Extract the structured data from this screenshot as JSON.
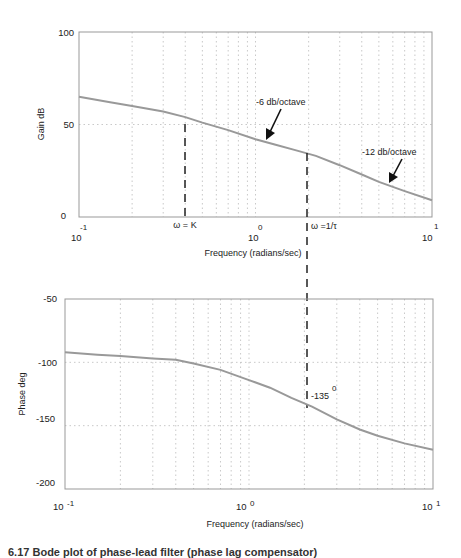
{
  "chart_data": [
    {
      "type": "line",
      "title": "",
      "xlabel": "Frequency (radians/sec)",
      "ylabel": "Gain dB",
      "xscale": "log",
      "xlim": [
        0.1,
        10
      ],
      "ylim": [
        0,
        100
      ],
      "yticks": [
        0,
        50,
        100
      ],
      "xticks": [
        {
          "base": "10",
          "exp": "-1"
        },
        {
          "base": "10",
          "exp": "0"
        },
        {
          "base": "10",
          "exp": "1"
        }
      ],
      "grid": true,
      "series": [
        {
          "name": "gain",
          "x": [
            0.1,
            0.15,
            0.2,
            0.3,
            0.4,
            0.5,
            0.7,
            1.0,
            1.3,
            1.7,
            2.2,
            3.0,
            4.0,
            5.0,
            7.0,
            10.0
          ],
          "y": [
            65,
            62,
            60,
            57,
            54,
            51,
            47,
            42,
            39,
            36,
            33,
            28,
            23,
            19,
            14,
            9
          ]
        }
      ],
      "annotations": [
        {
          "text": "-6 db/octave",
          "x": 1.3,
          "y": 40
        },
        {
          "text": "-12 db/octave",
          "x": 5.5,
          "y": 18
        },
        {
          "text": "ω = K",
          "x": 0.48,
          "marker": "dashed-vertical"
        },
        {
          "text": "ω =1/τ",
          "x": 2.2,
          "marker": "dashed-vertical"
        }
      ]
    },
    {
      "type": "line",
      "title": "",
      "xlabel": "Frequency (radians/sec)",
      "ylabel": "Phase deg",
      "xscale": "log",
      "xlim": [
        0.1,
        10
      ],
      "ylim": [
        -200,
        -50
      ],
      "yticks": [
        -200,
        -150,
        -100,
        -50
      ],
      "xticks": [
        {
          "base": "10",
          "exp": "-1"
        },
        {
          "base": "10",
          "exp": "0"
        },
        {
          "base": "10",
          "exp": "1"
        }
      ],
      "grid": true,
      "series": [
        {
          "name": "phase",
          "x": [
            0.1,
            0.15,
            0.2,
            0.3,
            0.4,
            0.5,
            0.7,
            1.0,
            1.3,
            1.7,
            2.2,
            3.0,
            4.0,
            5.0,
            7.0,
            10.0
          ],
          "y": [
            -92,
            -94,
            -95,
            -97,
            -98,
            -101,
            -106,
            -114,
            -120,
            -128,
            -135,
            -145,
            -153,
            -158,
            -164,
            -169
          ]
        }
      ],
      "annotations": [
        {
          "text": "-135",
          "sup": "0",
          "x": 2.2,
          "y": -135
        }
      ]
    }
  ],
  "labels": {
    "gain_ylabel": "Gain dB",
    "phase_ylabel": "Phase deg",
    "xlabel_top": "Frequency (radians/sec)",
    "xlabel_bottom": "Frequency (radians/sec)",
    "g100": "100",
    "g50": "50",
    "g0": "0",
    "p50": "-50",
    "p100": "-100",
    "p150": "-150",
    "p200": "-200",
    "tick_base": "10",
    "exp_m1": "-1",
    "exp_0": "0",
    "exp_1": "1",
    "ann_6": "-6 db/octave",
    "ann_12": "-12 db/octave",
    "ann_k": "ω = K",
    "ann_tau": "ω =1/τ",
    "ann_135": "-135",
    "ann_135_sup": "0"
  },
  "caption": "6.17  Bode plot of phase-lead filter (phase lag compensator)"
}
